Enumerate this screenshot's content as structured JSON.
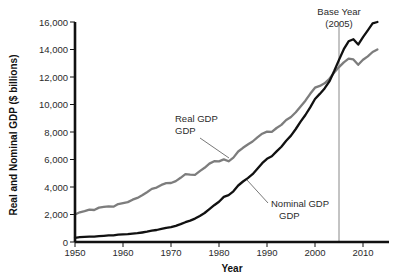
{
  "chart_data": {
    "type": "line",
    "title": "",
    "xlabel": "Year",
    "ylabel": "Real and Nominal GDP ($ billions)",
    "xlim": [
      1950,
      2013
    ],
    "ylim": [
      0,
      16000
    ],
    "grid": false,
    "legend_position": "inline-annotations",
    "x_ticks": [
      "1950",
      "1960",
      "1970",
      "1980",
      "1990",
      "2000",
      "2010"
    ],
    "x_tick_values": [
      1950,
      1960,
      1970,
      1980,
      1990,
      2000,
      2010
    ],
    "y_ticks": [
      "0",
      "2,000",
      "4,000",
      "6,000",
      "8,000",
      "10,000",
      "12,000",
      "14,000",
      "16,000"
    ],
    "y_tick_values": [
      0,
      2000,
      4000,
      6000,
      8000,
      10000,
      12000,
      14000,
      16000
    ],
    "x": [
      1950,
      1951,
      1952,
      1953,
      1954,
      1955,
      1956,
      1957,
      1958,
      1959,
      1960,
      1961,
      1962,
      1963,
      1964,
      1965,
      1966,
      1967,
      1968,
      1969,
      1970,
      1971,
      1972,
      1973,
      1974,
      1975,
      1976,
      1977,
      1978,
      1979,
      1980,
      1981,
      1982,
      1983,
      1984,
      1985,
      1986,
      1987,
      1988,
      1989,
      1990,
      1991,
      1992,
      1993,
      1994,
      1995,
      1996,
      1997,
      1998,
      1999,
      2000,
      2001,
      2002,
      2003,
      2004,
      2005,
      2006,
      2007,
      2008,
      2009,
      2010,
      2011,
      2012,
      2013
    ],
    "series": [
      {
        "name": "Real GDP",
        "color": "#7d7d7d",
        "label_text": "Real\nGDP",
        "values": [
          2000,
          2160,
          2240,
          2350,
          2330,
          2500,
          2550,
          2600,
          2570,
          2760,
          2830,
          2900,
          3080,
          3210,
          3400,
          3620,
          3860,
          3960,
          4150,
          4280,
          4290,
          4430,
          4670,
          4930,
          4900,
          4890,
          5160,
          5400,
          5700,
          5880,
          5860,
          6010,
          5870,
          6140,
          6580,
          6850,
          7090,
          7310,
          7610,
          7880,
          8030,
          8010,
          8290,
          8520,
          8870,
          9090,
          9430,
          9850,
          10280,
          10780,
          11220,
          11350,
          11540,
          11870,
          12320,
          12720,
          13060,
          13330,
          13280,
          12890,
          13250,
          13500,
          13820,
          14000
        ]
      },
      {
        "name": "Nominal GDP",
        "color": "#111111",
        "label_text": "Nominal\nGDP",
        "values": [
          300,
          350,
          370,
          390,
          390,
          430,
          450,
          480,
          490,
          530,
          550,
          570,
          610,
          640,
          690,
          750,
          820,
          870,
          950,
          1030,
          1080,
          1180,
          1300,
          1440,
          1560,
          1700,
          1900,
          2110,
          2390,
          2680,
          2930,
          3280,
          3410,
          3690,
          4110,
          4400,
          4650,
          4930,
          5330,
          5730,
          6050,
          6230,
          6590,
          6930,
          7370,
          7740,
          8220,
          8750,
          9240,
          9800,
          10400,
          10770,
          11170,
          11680,
          12440,
          13240,
          14020,
          14600,
          14750,
          14360,
          14900,
          15400,
          15900,
          16000
        ]
      }
    ],
    "annotations": [
      {
        "name": "base-year",
        "text_line1": "Base Year",
        "text_line2": "(2005)",
        "x_value": 2005,
        "rule_top": 16000,
        "rule_bottom": 0
      }
    ]
  }
}
